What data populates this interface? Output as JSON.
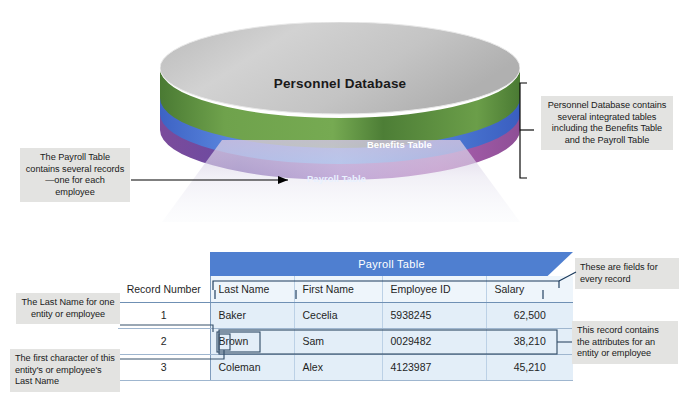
{
  "cylinder": {
    "title": "Personnel Database",
    "bands": [
      {
        "name": "top-surface",
        "label": "",
        "color": "#c9c9c9"
      },
      {
        "name": "benefits-band",
        "label": "Benefits Table",
        "color": "#5f9341"
      },
      {
        "name": "payroll-band",
        "label": "Payroll Table",
        "color": "#4f8ede"
      },
      {
        "name": "base-band",
        "label": "",
        "color": "#8e5ba6"
      }
    ]
  },
  "table": {
    "banner": "Payroll Table",
    "columns": [
      "Record Number",
      "Last Name",
      "First Name",
      "Employee ID",
      "Salary"
    ],
    "rows": [
      {
        "record_number": "1",
        "last_name": "Baker",
        "first_name": "Cecelia",
        "employee_id": "5938245",
        "salary": "62,500"
      },
      {
        "record_number": "2",
        "last_name": "Brown",
        "first_name": "Sam",
        "employee_id": "0029482",
        "salary": "38,210"
      },
      {
        "record_number": "3",
        "last_name": "Coleman",
        "first_name": "Alex",
        "employee_id": "4123987",
        "salary": "45,210"
      }
    ]
  },
  "annotations": {
    "payroll_records": "The Payroll Table contains several records—one for each employee",
    "personnel_database": "Personnel Database contains several integrated tables including the Benefits Table and the Payroll Table",
    "fields": "These are fields for every record",
    "last_name_entity": "The Last Name for one  entity or employee",
    "record_attributes": "This record contains the attributes for an entity or employee",
    "first_character": "The first character of this entity's or employee's Last Name"
  },
  "colors": {
    "cylinder_top": "#c9c9c9",
    "benefits_green": "#5f9341",
    "payroll_blue": "#4f8ede",
    "base_purple": "#8e5ba6",
    "banner_blue": "#4f7fd0",
    "cell_blue": "#e3eef8",
    "callout_gray": "#e3e3e1",
    "line_black": "#000000"
  }
}
